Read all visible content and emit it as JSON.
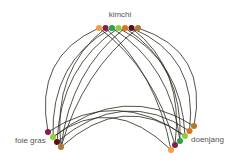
{
  "diagram": {
    "type": "hive-plot",
    "groups": [
      {
        "id": "kimchi",
        "label": "kimchi",
        "label_pos": [
          120,
          17
        ],
        "nodes": [
          {
            "id": "k0",
            "x": 99,
            "y": 28,
            "color": "#f0a040"
          },
          {
            "id": "k1",
            "x": 105.5,
            "y": 28,
            "color": "#8a1a4a"
          },
          {
            "id": "k2",
            "x": 112,
            "y": 28,
            "color": "#2e9e4a"
          },
          {
            "id": "k3",
            "x": 118.5,
            "y": 28,
            "color": "#8ccf3a"
          },
          {
            "id": "k4",
            "x": 125,
            "y": 28,
            "color": "#d9731f"
          },
          {
            "id": "k5",
            "x": 131.5,
            "y": 28,
            "color": "#5a1010"
          },
          {
            "id": "k6",
            "x": 138,
            "y": 28,
            "color": "#b07a30"
          }
        ]
      },
      {
        "id": "foie-gras",
        "label": "foie gras",
        "label_pos": [
          15,
          143
        ],
        "nodes": [
          {
            "id": "f0",
            "x": 48,
            "y": 132,
            "color": "#8a1a4a"
          },
          {
            "id": "f1",
            "x": 53,
            "y": 137,
            "color": "#8ccf3a"
          },
          {
            "id": "f2",
            "x": 57,
            "y": 142,
            "color": "#5a1010"
          },
          {
            "id": "f3",
            "x": 61,
            "y": 147,
            "color": "#b07a30"
          }
        ]
      },
      {
        "id": "doenjang",
        "label": "doenjang",
        "label_pos": [
          191,
          142
        ],
        "nodes": [
          {
            "id": "d0",
            "x": 194,
            "y": 126,
            "color": "#b07a30"
          },
          {
            "id": "d1",
            "x": 189.5,
            "y": 131,
            "color": "#d9731f"
          },
          {
            "id": "d2",
            "x": 185,
            "y": 136,
            "color": "#8ccf3a"
          },
          {
            "id": "d3",
            "x": 180,
            "y": 141,
            "color": "#2e9e4a"
          },
          {
            "id": "d4",
            "x": 175,
            "y": 145,
            "color": "#8a1a4a"
          },
          {
            "id": "d5",
            "x": 171,
            "y": 150,
            "color": "#f0a040"
          }
        ]
      }
    ],
    "edges": [
      {
        "from": "k0",
        "to": "f0"
      },
      {
        "from": "k0",
        "to": "d4"
      },
      {
        "from": "k1",
        "to": "f3"
      },
      {
        "from": "k1",
        "to": "d5"
      },
      {
        "from": "k2",
        "to": "f1"
      },
      {
        "from": "k2",
        "to": "d3"
      },
      {
        "from": "k3",
        "to": "f2"
      },
      {
        "from": "k3",
        "to": "d2"
      },
      {
        "from": "k4",
        "to": "d3"
      },
      {
        "from": "k4",
        "to": "f3"
      },
      {
        "from": "k5",
        "to": "d1"
      },
      {
        "from": "k5",
        "to": "d4"
      },
      {
        "from": "k6",
        "to": "d0"
      },
      {
        "from": "k6",
        "to": "f3"
      },
      {
        "from": "f0",
        "to": "d2"
      },
      {
        "from": "f1",
        "to": "d0"
      },
      {
        "from": "f2",
        "to": "d1"
      },
      {
        "from": "f3",
        "to": "d2"
      },
      {
        "from": "f1",
        "to": "d5"
      }
    ],
    "edge_color": "#2a2a1e",
    "label_color": "#555555"
  }
}
